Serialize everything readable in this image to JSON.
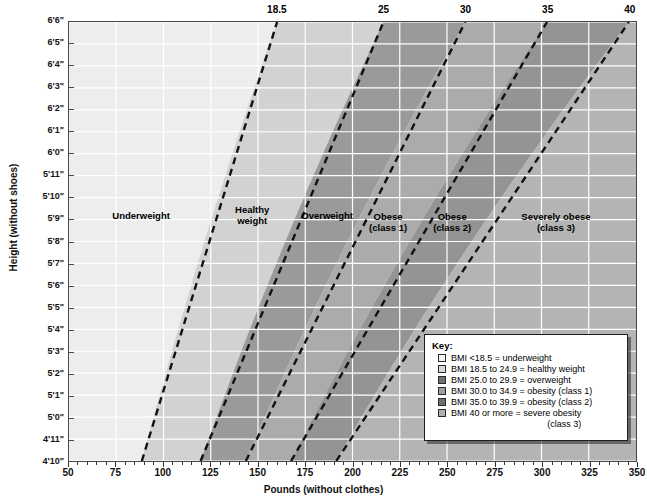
{
  "chart_data": {
    "type": "line",
    "xlabel": "Pounds (without clothes)",
    "ylabel": "Height (without shoes)",
    "xlim": [
      50,
      350
    ],
    "ylim_inches": [
      58,
      78
    ],
    "x_ticks": [
      50,
      75,
      100,
      125,
      150,
      175,
      200,
      225,
      250,
      275,
      300,
      325,
      350
    ],
    "x_minor_step": 5,
    "y_ticks": [
      "4'10\"",
      "4'11\"",
      "5'0\"",
      "5'1\"",
      "5'2\"",
      "5'3\"",
      "5'4\"",
      "5'5\"",
      "5'6\"",
      "5'7\"",
      "5'8\"",
      "5'9\"",
      "5'10\"",
      "5'11\"",
      "6'0\"",
      "6'1\"",
      "6'2\"",
      "6'3\"",
      "6'4\"",
      "6'5\"",
      "6'6\""
    ],
    "grid": true,
    "legend_position": "inside bottom-right",
    "top_axis_label": "BMI",
    "series": [
      {
        "name": "18.5",
        "bmi": 18.5,
        "style": "dashed",
        "points": [
          {
            "height_in": 58,
            "pounds": 88.5
          },
          {
            "height_in": 78,
            "pounds": 160.1
          }
        ]
      },
      {
        "name": "25",
        "bmi": 25,
        "style": "dashed",
        "points": [
          {
            "height_in": 58,
            "pounds": 119.6
          },
          {
            "height_in": 78,
            "pounds": 216.4
          }
        ]
      },
      {
        "name": "30",
        "bmi": 30,
        "style": "dashed",
        "points": [
          {
            "height_in": 58,
            "pounds": 143.5
          },
          {
            "height_in": 78,
            "pounds": 259.6
          }
        ]
      },
      {
        "name": "35",
        "bmi": 35,
        "style": "dashed",
        "points": [
          {
            "height_in": 58,
            "pounds": 167.4
          },
          {
            "height_in": 78,
            "pounds": 302.9
          }
        ]
      },
      {
        "name": "40",
        "bmi": 40,
        "style": "dashed",
        "points": [
          {
            "height_in": 58,
            "pounds": 191.3
          },
          {
            "height_in": 78,
            "pounds": 346.2
          }
        ]
      }
    ],
    "bands": [
      {
        "label": "Underweight",
        "bmi_from": 0,
        "bmi_to": 18.5,
        "color": "#ededed"
      },
      {
        "label": "Healthy weight",
        "bmi_from": 18.5,
        "bmi_to": 25,
        "color": "#d2d2d2"
      },
      {
        "label": "Overweight",
        "bmi_from": 25,
        "bmi_to": 30,
        "color": "#9a9a9a"
      },
      {
        "label": "Obese (class 1)",
        "bmi_from": 30,
        "bmi_to": 35,
        "color": "#ababab"
      },
      {
        "label": "Obese (class 2)",
        "bmi_from": 35,
        "bmi_to": 40,
        "color": "#949494"
      },
      {
        "label": "Severely obese (class 3)",
        "bmi_from": 40,
        "bmi_to": 100,
        "color": "#b4b4b4"
      }
    ]
  },
  "axes": {
    "x_title": "Pounds (without clothes)",
    "y_title": "Height (without shoes)",
    "x_ticks": [
      "50",
      "75",
      "100",
      "125",
      "150",
      "175",
      "200",
      "225",
      "250",
      "275",
      "300",
      "325",
      "350"
    ],
    "y_ticks": [
      "6'6\"",
      "6'5\"",
      "6'4\"",
      "6'3\"",
      "6'2\"",
      "6'1\"",
      "6'0\"",
      "5'11\"",
      "5'10\"",
      "5'9\"",
      "5'8\"",
      "5'7\"",
      "5'6\"",
      "5'5\"",
      "5'4\"",
      "5'3\"",
      "5'2\"",
      "5'1\"",
      "5'0\"",
      "4'11\"",
      "4'10\""
    ],
    "top_bmi_labels": [
      "18.5",
      "25",
      "30",
      "35",
      "40"
    ]
  },
  "band_labels": [
    {
      "text_line1": "Underweight",
      "text_line2": ""
    },
    {
      "text_line1": "Healthy",
      "text_line2": "weight"
    },
    {
      "text_line1": "Overweight",
      "text_line2": ""
    },
    {
      "text_line1": "Obese",
      "text_line2": "(class 1)"
    },
    {
      "text_line1": "Obese",
      "text_line2": "(class 2)"
    },
    {
      "text_line1": "Severely obese",
      "text_line2": "(class 3)"
    }
  ],
  "key": {
    "title": "Key:",
    "items": [
      {
        "label": "BMI <18.5 = underweight",
        "label2": "",
        "color": "#f4f4f4"
      },
      {
        "label": "BMI 18.5 to 24.9 = healthy weight",
        "label2": "",
        "color": "#d8d8d8"
      },
      {
        "label": "BMI 25.0 to 29.9 = overweight",
        "label2": "",
        "color": "#6f6f6f"
      },
      {
        "label": "BMI 30.0 to 34.9 = obesity (class 1)",
        "label2": "",
        "color": "#9e9e9e"
      },
      {
        "label": "BMI 35.0 to 39.9 = obesity (class 2)",
        "label2": "",
        "color": "#717171"
      },
      {
        "label": "BMI 40 or more = severe obesity",
        "label2": "(class 3)",
        "color": "#b0b0b0"
      }
    ]
  }
}
